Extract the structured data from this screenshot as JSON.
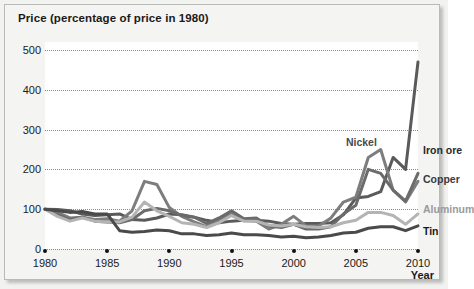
{
  "chart": {
    "title": "Price (percentage of price in 1980)",
    "xaxis_title": "Year"
  },
  "chart_data": {
    "type": "line",
    "title": "Price (percentage of price in 1980)",
    "xlabel": "Year",
    "ylabel": "Price (percentage of price in 1980)",
    "xlim": [
      1980,
      2010
    ],
    "ylim": [
      0,
      520
    ],
    "yticks": [
      0,
      100,
      200,
      300,
      400,
      500
    ],
    "xticks": [
      1980,
      1985,
      1990,
      1995,
      2000,
      2005,
      2010
    ],
    "grid": "horizontal-dotted",
    "legend": "inline-end-labels",
    "x": [
      1980,
      1981,
      1982,
      1983,
      1984,
      1985,
      1986,
      1987,
      1988,
      1989,
      1990,
      1991,
      1992,
      1993,
      1994,
      1995,
      1996,
      1997,
      1998,
      1999,
      2000,
      2001,
      2002,
      2003,
      2004,
      2005,
      2006,
      2007,
      2008,
      2009,
      2010
    ],
    "series": [
      {
        "name": "Iron ore",
        "color": "#5a5a5a",
        "label_color": "#2a2a2a",
        "values": [
          100,
          99,
          96,
          88,
          84,
          86,
          88,
          74,
          72,
          78,
          88,
          86,
          80,
          72,
          66,
          70,
          72,
          72,
          70,
          64,
          62,
          64,
          64,
          66,
          86,
          128,
          132,
          144,
          230,
          200,
          470
        ]
      },
      {
        "name": "Nickel",
        "color": "#7d7d7d",
        "label_color": "#4a4a4a",
        "values": [
          100,
          92,
          78,
          80,
          74,
          76,
          70,
          96,
          170,
          162,
          104,
          82,
          68,
          56,
          74,
          90,
          72,
          70,
          50,
          62,
          82,
          58,
          58,
          78,
          118,
          130,
          230,
          250,
          148,
          118,
          170
        ]
      },
      {
        "name": "Copper",
        "color": "#6b6b6b",
        "label_color": "#3a3a3a",
        "values": [
          100,
          86,
          74,
          80,
          70,
          68,
          66,
          74,
          96,
          102,
          96,
          84,
          80,
          64,
          78,
          96,
          76,
          78,
          58,
          54,
          62,
          50,
          50,
          56,
          88,
          110,
          200,
          190,
          148,
          120,
          190
        ]
      },
      {
        "name": "Aluminum",
        "color": "#b4b4b4",
        "label_color": "#9a9a9a",
        "values": [
          100,
          82,
          70,
          78,
          70,
          68,
          68,
          80,
          118,
          96,
          82,
          66,
          62,
          54,
          66,
          84,
          70,
          70,
          60,
          58,
          62,
          56,
          54,
          56,
          66,
          72,
          92,
          92,
          84,
          62,
          88
        ]
      },
      {
        "name": "Tin",
        "color": "#4a4a4a",
        "label_color": "#1a1a1a",
        "values": [
          100,
          96,
          92,
          94,
          88,
          88,
          46,
          42,
          44,
          48,
          46,
          38,
          38,
          34,
          36,
          40,
          36,
          36,
          34,
          30,
          32,
          28,
          30,
          34,
          40,
          42,
          52,
          56,
          56,
          46,
          58
        ]
      }
    ],
    "annotations": [
      {
        "text": "Nickel",
        "x": 2004.2,
        "y": 268,
        "color": "#4a4a4a"
      },
      {
        "text": "Iron ore",
        "x": 2010.4,
        "y": 248,
        "color": "#2a2a2a"
      },
      {
        "text": "Copper",
        "x": 2010.4,
        "y": 176,
        "color": "#3a3a3a"
      },
      {
        "text": "Aluminum",
        "x": 2010.4,
        "y": 100,
        "color": "#9a9a9a"
      },
      {
        "text": "Tin",
        "x": 2010.4,
        "y": 44,
        "color": "#1a1a1a"
      }
    ]
  }
}
